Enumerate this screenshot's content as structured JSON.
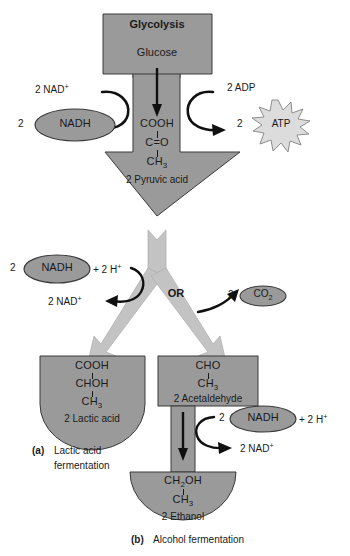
{
  "figure": {
    "colors": {
      "shape_gray": "#9a9a9a",
      "arrow_light_gray": "#c3c3c3",
      "atp_gray": "#dcdcdc",
      "outline": "#3a3a3a",
      "text": "#1a1a1a",
      "background": "#ffffff"
    }
  },
  "glycolysis": {
    "title": "Glycolysis",
    "substrate": "Glucose"
  },
  "glycolysis_cofactors": {
    "nad_in": "2 NAD",
    "nad_in_charge": "+",
    "nadh_count": "2",
    "nadh_label": "NADH",
    "adp_in": "2 ADP",
    "atp_count": "2",
    "atp_label": "ATP"
  },
  "pyruvate": {
    "line1": "COOH",
    "line2": "C=O",
    "line3": "CH",
    "line3_sub": "3",
    "name": "2 Pyruvic acid"
  },
  "branch": {
    "or_label": "OR",
    "left_cofactor_count": "2",
    "left_cofactor_label": "NADH",
    "left_cofactor_plus": "+ 2 H",
    "left_cofactor_plus_charge": "+",
    "left_product": "2 NAD",
    "left_product_charge": "+",
    "right_count": "2",
    "right_label": "CO",
    "right_label_sub": "2"
  },
  "lactic": {
    "line1": "COOH",
    "line2": "CHOH",
    "line3": "CH",
    "line3_sub": "3",
    "name": "2 Lactic acid",
    "caption_tag": "(a)",
    "caption_line1": "Lactic acid",
    "caption_line2": "fermentation"
  },
  "acetaldehyde": {
    "line1": "CHO",
    "line2": "CH",
    "line2_sub": "3",
    "name": "2 Acetaldehyde"
  },
  "alcohol_step": {
    "nadh_count": "2",
    "nadh_label": "NADH",
    "nadh_plus": "+ 2 H",
    "nadh_plus_charge": "+",
    "product": "2 NAD",
    "product_charge": "+"
  },
  "ethanol": {
    "line1": "CH",
    "line1_sub": "2",
    "line1_rest": "OH",
    "line2": "CH",
    "line2_sub": "3",
    "name": "2 Ethanol",
    "caption_tag": "(b)",
    "caption_text": "Alcohol fermentation"
  }
}
